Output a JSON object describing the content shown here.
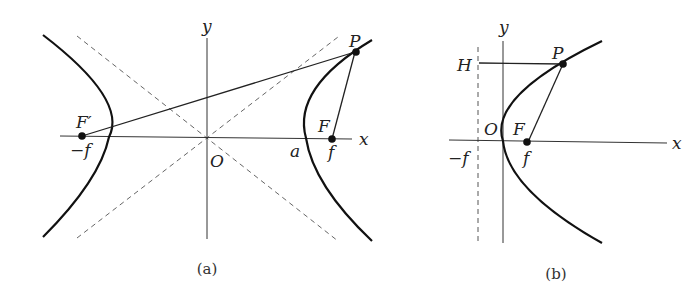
{
  "figures": [
    {
      "id": "a",
      "caption": "(a)",
      "type": "hyperbola",
      "labels": {
        "x_axis": "x",
        "y_axis": "y",
        "origin": "O",
        "focus_right": "F",
        "focus_left": "F′",
        "point": "P",
        "vertex": "a",
        "focus_right_coord": "f",
        "focus_left_coord": "−f"
      }
    },
    {
      "id": "b",
      "caption": "(b)",
      "type": "parabola",
      "labels": {
        "x_axis": "x",
        "y_axis": "y",
        "origin": "O",
        "focus": "F",
        "point": "P",
        "foot_on_directrix": "H",
        "focus_coord": "f",
        "directrix_coord": "−f"
      }
    }
  ],
  "colors": {
    "ink": "#222222",
    "dashed": "#555555",
    "background": "#ffffff"
  }
}
